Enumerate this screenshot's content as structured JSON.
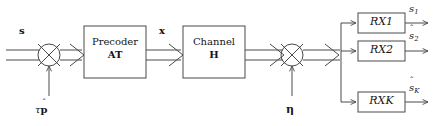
{
  "figure": {
    "type": "block-diagram",
    "domain": "MIMO downlink signal chain",
    "background": "#ffffff",
    "stroke_color": "#4a4a4a",
    "text_color": "#151515",
    "width": 434,
    "height": 126
  },
  "blocks": [
    {
      "id": "precoder",
      "line1": "Precoder",
      "line2_base": "A",
      "line2_sub": "T",
      "x": 84,
      "y": 26,
      "w": 62,
      "h": 52
    },
    {
      "id": "channel",
      "line1": "Channel",
      "line2_base": "H",
      "line2_sub": "",
      "x": 183,
      "y": 26,
      "w": 62,
      "h": 52
    },
    {
      "id": "rx1",
      "line1": "RX",
      "line2_base": "",
      "line2_sub": "1",
      "x": 358,
      "y": 13,
      "w": 47,
      "h": 20
    },
    {
      "id": "rx2",
      "line1": "RX",
      "line2_base": "",
      "line2_sub": "2",
      "x": 358,
      "y": 41,
      "w": 47,
      "h": 20
    },
    {
      "id": "rxk",
      "line1": "RX",
      "line2_base": "",
      "line2_sub": "K",
      "x": 358,
      "y": 92,
      "w": 47,
      "h": 20
    }
  ],
  "junctions": [
    {
      "id": "sum-left",
      "cx": 49,
      "cy": 55,
      "r": 11,
      "marker": "cross"
    },
    {
      "id": "sum-right",
      "cx": 292,
      "cy": 55,
      "r": 11,
      "marker": "cross"
    }
  ],
  "labels": {
    "input_signal": {
      "text": "s",
      "x": 19,
      "y": 25
    },
    "pilot_term": {
      "tau": "τ",
      "base": "p",
      "hat": "ˆ",
      "x": 35,
      "y": 104
    },
    "precoded_signal": {
      "text": "x",
      "x": 159,
      "y": 25
    },
    "noise": {
      "text": "η",
      "x": 286,
      "y": 104
    },
    "estimates": [
      {
        "id": "s-hat-1",
        "base": "s",
        "hat": "ˆ",
        "sub": "1",
        "x": 409,
        "y": 3
      },
      {
        "id": "s-hat-2",
        "base": "s",
        "hat": "ˆ",
        "sub": "2",
        "x": 409,
        "y": 30
      },
      {
        "id": "s-hat-K",
        "base": "s",
        "hat": "ˆ",
        "sub": "K",
        "x": 409,
        "y": 82
      }
    ]
  },
  "connections": [
    {
      "id": "s-to-sum-left",
      "style": "vector-double",
      "from": "input",
      "to": "sum-left"
    },
    {
      "id": "pilot-to-sum-left",
      "style": "single",
      "from": "pilot-term",
      "to": "sum-left"
    },
    {
      "id": "sum-left-to-precoder",
      "style": "vector-double",
      "from": "sum-left",
      "to": "precoder"
    },
    {
      "id": "precoder-to-channel",
      "style": "vector-double",
      "from": "precoder",
      "to": "channel"
    },
    {
      "id": "channel-to-sum-right",
      "style": "vector-double",
      "from": "channel",
      "to": "sum-right"
    },
    {
      "id": "noise-to-sum-right",
      "style": "single",
      "from": "noise",
      "to": "sum-right"
    },
    {
      "id": "sum-right-to-split",
      "style": "vector-double",
      "from": "sum-right",
      "to": "split-node"
    },
    {
      "id": "split-to-rx1",
      "style": "single",
      "from": "split-node",
      "to": "rx1"
    },
    {
      "id": "split-to-rx2",
      "style": "single",
      "from": "split-node",
      "to": "rx2"
    },
    {
      "id": "split-to-rxk",
      "style": "single",
      "from": "split-node",
      "to": "rxk"
    },
    {
      "id": "rx1-to-out",
      "style": "single",
      "from": "rx1",
      "to": "s-hat-1"
    },
    {
      "id": "rx2-to-out",
      "style": "single",
      "from": "rx2",
      "to": "s-hat-2"
    },
    {
      "id": "rxk-to-out",
      "style": "single",
      "from": "rxk",
      "to": "s-hat-K"
    }
  ]
}
